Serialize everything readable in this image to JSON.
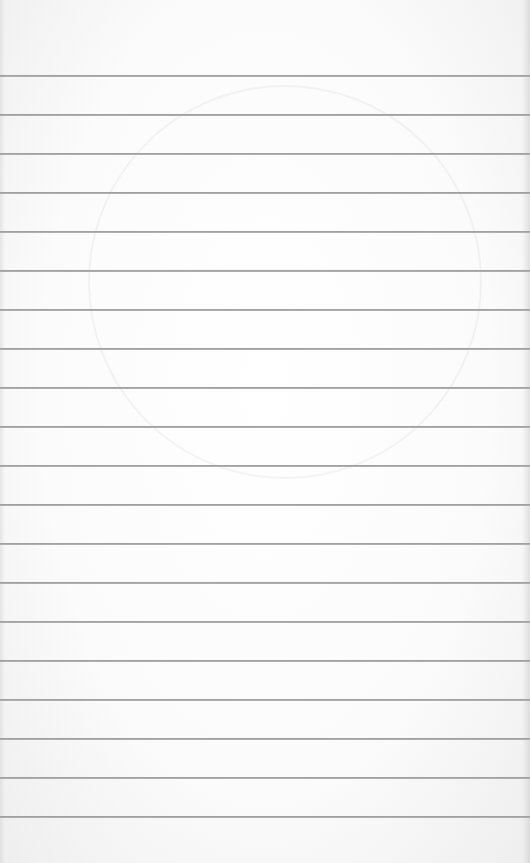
{
  "image": {
    "subject": "blank ruled notebook paper",
    "background_color": "#fbfbfb",
    "rule_color": "#a0a0a0",
    "rule_count": 20,
    "first_rule_y": 75,
    "rule_spacing": 39
  }
}
